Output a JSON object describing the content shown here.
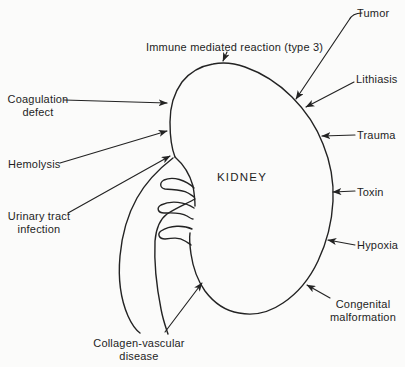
{
  "diagram": {
    "organ_label": "KIDNEY",
    "causes": {
      "immune_mediated_reaction": "Immune mediated reaction (type 3)",
      "tumor": "Tumor",
      "lithiasis": "Lithiasis",
      "trauma": "Trauma",
      "toxin": "Toxin",
      "hypoxia": "Hypoxia",
      "congenital_malformation": "Congenital malformation",
      "collagen_vascular_disease": "Collagen-vascular disease",
      "coagulation_defect": "Coagulation defect",
      "hemolysis": "Hemolysis",
      "urinary_tract_infection": "Urinary tract infection"
    },
    "colors": {
      "ink": "#232323",
      "background": "#fbfbfa"
    }
  }
}
